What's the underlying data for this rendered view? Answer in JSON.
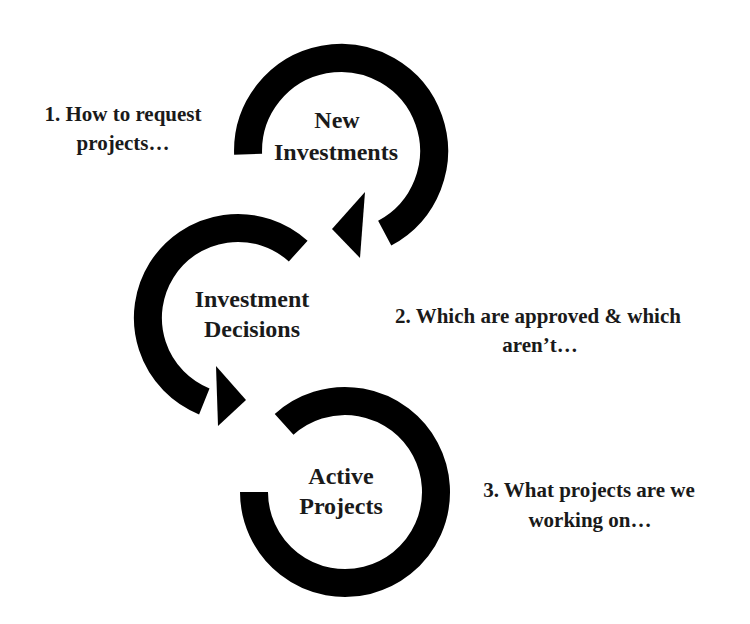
{
  "diagram": {
    "type": "cycle-flow",
    "stages": [
      {
        "id": "new-investments",
        "lines": [
          "New",
          "Investments"
        ],
        "note_lines": [
          "1. How to request",
          "projects…"
        ],
        "has_arrowhead": true
      },
      {
        "id": "investment-decisions",
        "lines": [
          "Investment",
          "Decisions"
        ],
        "note_lines": [
          "2. Which are approved & which",
          "aren’t…"
        ],
        "has_arrowhead": true
      },
      {
        "id": "active-projects",
        "lines": [
          "Active",
          "Projects"
        ],
        "note_lines": [
          "3. What projects are we",
          "working on…"
        ],
        "has_arrowhead": false
      }
    ],
    "colors": {
      "arrow": "#000000",
      "text": "#1a1a1a",
      "background": "#ffffff"
    }
  }
}
